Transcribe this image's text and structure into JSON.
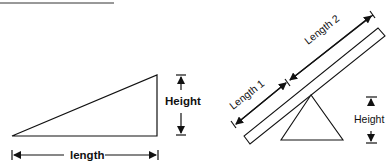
{
  "diagram": {
    "ramp": {
      "height_label": "Height",
      "length_label": "length"
    },
    "seesaw": {
      "length1_label": "Length 1",
      "length2_label": "Length 2",
      "height_label": "Height"
    },
    "colors": {
      "stroke": "#111111",
      "background": "#ffffff"
    }
  }
}
